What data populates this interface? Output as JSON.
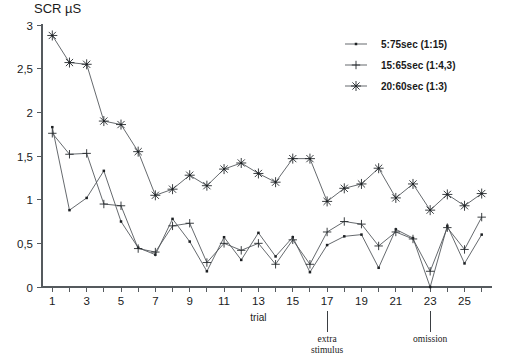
{
  "chart_data": {
    "type": "line",
    "title": "SCR µS",
    "xlabel": "trial",
    "ylabel": "SCR µS",
    "xlim": [
      0.4,
      26.6
    ],
    "ylim": [
      0,
      3
    ],
    "grid": false,
    "legend_position": "top-right",
    "x": [
      1,
      2,
      3,
      4,
      5,
      6,
      7,
      8,
      9,
      10,
      11,
      12,
      13,
      14,
      15,
      16,
      17,
      18,
      19,
      20,
      21,
      22,
      23,
      24,
      25,
      26
    ],
    "xticks": [
      1,
      3,
      5,
      7,
      9,
      11,
      13,
      15,
      17,
      19,
      21,
      23,
      25
    ],
    "xticklabels": [
      "1",
      "3",
      "5",
      "7",
      "9",
      "11",
      "13",
      "15",
      "17",
      "19",
      "21",
      "23",
      "25"
    ],
    "yticks": [
      0,
      0.5,
      1,
      1.5,
      2,
      2.5,
      3
    ],
    "yticklabels": [
      "0",
      "0,5",
      "1",
      "1,5",
      "2",
      "2,5",
      "3"
    ],
    "series": [
      {
        "name": "5:75sec (1:15)",
        "marker": "square",
        "values": [
          1.83,
          0.88,
          1.02,
          1.33,
          0.75,
          0.45,
          0.37,
          0.78,
          0.52,
          0.18,
          0.57,
          0.31,
          0.62,
          0.35,
          0.57,
          0.17,
          0.48,
          0.58,
          0.6,
          0.22,
          0.66,
          0.56,
          0.0,
          0.7,
          0.27,
          0.6
        ]
      },
      {
        "name": "15:65sec (1:4,3)",
        "marker": "plus",
        "values": [
          1.76,
          1.52,
          1.53,
          0.95,
          0.93,
          0.44,
          0.4,
          0.7,
          0.73,
          0.28,
          0.5,
          0.42,
          0.5,
          0.26,
          0.54,
          0.26,
          0.63,
          0.75,
          0.72,
          0.47,
          0.63,
          0.55,
          0.18,
          0.68,
          0.43,
          0.8
        ]
      },
      {
        "name": "20:60sec (1:3)",
        "marker": "asterisk",
        "values": [
          2.88,
          2.57,
          2.55,
          1.9,
          1.86,
          1.55,
          1.05,
          1.12,
          1.28,
          1.16,
          1.35,
          1.42,
          1.3,
          1.2,
          1.47,
          1.47,
          0.98,
          1.13,
          1.18,
          1.36,
          1.02,
          1.18,
          0.88,
          1.06,
          0.93,
          1.07
        ]
      }
    ],
    "annotations": [
      {
        "label": "extra\nstimulus",
        "line1": "extra",
        "line2": "stimulus",
        "x": 17
      },
      {
        "label": "omission",
        "line1": "omission",
        "line2": "",
        "x": 23
      }
    ]
  },
  "legend": {
    "items": [
      {
        "label": "5:75sec (1:15)",
        "marker": "square"
      },
      {
        "label": "15:65sec (1:4,3)",
        "marker": "plus"
      },
      {
        "label": "20:60sec (1:3)",
        "marker": "asterisk"
      }
    ]
  },
  "axis": {
    "x_title": "trial",
    "y_title": "SCR µS"
  }
}
